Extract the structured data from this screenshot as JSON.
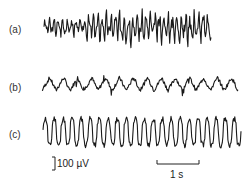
{
  "figure": {
    "panels": [
      {
        "id": "a",
        "label": "(a)",
        "label_x": 9,
        "label_y": 24,
        "x_start": 44,
        "x_end": 211,
        "y_center": 27,
        "amplitude": 14,
        "cycles": 38,
        "style": "fast-irregular",
        "seed": 3
      },
      {
        "id": "b",
        "label": "(b)",
        "label_x": 9,
        "label_y": 82,
        "x_start": 42,
        "x_end": 238,
        "y_center": 84,
        "amplitude": 8,
        "cycles": 14,
        "style": "rhythmic-spiky",
        "seed": 7
      },
      {
        "id": "c",
        "label": "(c)",
        "label_x": 9,
        "label_y": 129,
        "x_start": 43,
        "x_end": 241,
        "y_center": 132,
        "amplitude": 15,
        "cycles": 22,
        "style": "high-amplitude-rhythmic",
        "seed": 11
      }
    ],
    "scale_bars": {
      "voltage": {
        "label": "100 µV",
        "x": 55,
        "y_top": 157,
        "y_bottom": 170
      },
      "time": {
        "label": "1 s",
        "x_start": 157,
        "x_end": 199,
        "y": 164
      }
    }
  }
}
